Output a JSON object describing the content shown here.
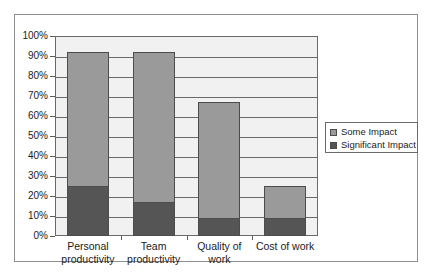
{
  "chart_data": {
    "type": "bar",
    "subtype": "stacked-bar",
    "title": "",
    "subtitle": "",
    "xlabel": "",
    "ylabel": "",
    "categories": [
      "Personal productivity",
      "Team productivity",
      "Quality of work",
      "Cost of work"
    ],
    "series": [
      {
        "name": "Significant Impact",
        "values": [
          25,
          17,
          9,
          9
        ],
        "color": "#555555"
      },
      {
        "name": "Some Impact",
        "values": [
          67,
          75,
          58,
          16
        ],
        "color": "#9a9a9a"
      }
    ],
    "stack_totals": [
      92,
      92,
      67,
      25
    ],
    "ylim": [
      0,
      100
    ],
    "y_tick_labels": [
      "100%",
      "90%",
      "80%",
      "70%",
      "60%",
      "50%",
      "40%",
      "30%",
      "20%",
      "10%",
      "0%"
    ],
    "y_tick_values": [
      100,
      90,
      80,
      70,
      60,
      50,
      40,
      30,
      20,
      10,
      0
    ],
    "grid": true,
    "grid_axis": "y",
    "legend_position": "right",
    "legend_entries": [
      {
        "label": "Some Impact",
        "color": "#9a9a9a"
      },
      {
        "label": "Significant Impact",
        "color": "#555555"
      }
    ],
    "plot_background": "#f1f1f1",
    "figure_background": "#ffffff",
    "border_color": "#6a6a6a"
  }
}
